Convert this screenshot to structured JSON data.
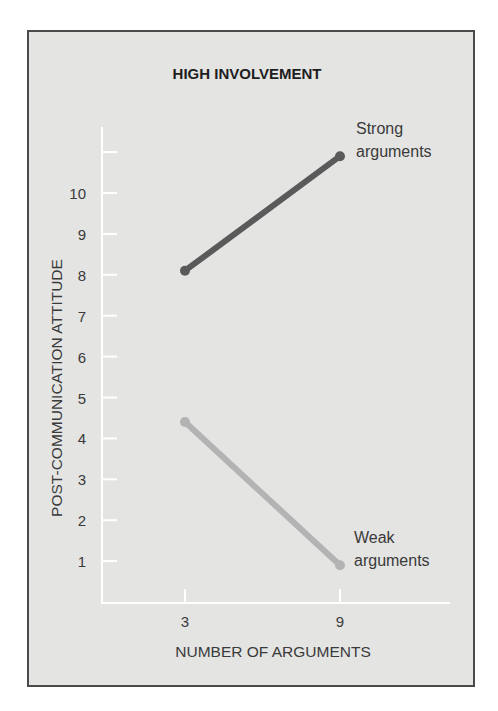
{
  "chart_data": {
    "type": "line",
    "title": "HIGH INVOLVEMENT",
    "xlabel": "NUMBER OF ARGUMENTS",
    "ylabel": "POST-COMMUNICATION ATTITUDE",
    "categories": [
      "3",
      "9"
    ],
    "x": [
      3,
      9
    ],
    "series": [
      {
        "name": "Strong arguments",
        "label_lines": [
          "Strong",
          "arguments"
        ],
        "values": [
          8.1,
          10.9
        ],
        "color": "#5a5a5a"
      },
      {
        "name": "Weak arguments",
        "label_lines": [
          "Weak",
          "arguments"
        ],
        "values": [
          4.4,
          0.9
        ],
        "color": "#b3b3b3"
      }
    ],
    "y_ticks": [
      1,
      2,
      3,
      4,
      5,
      6,
      7,
      8,
      9,
      10
    ],
    "y_tick_unlabeled": [
      11
    ],
    "ylim": [
      0,
      11.5
    ],
    "grid": false,
    "legend": "inline labels at line ends",
    "colors": {
      "background": "#e4e4e3",
      "frame": "#4a4a4a",
      "axis": "#ffffff"
    }
  }
}
